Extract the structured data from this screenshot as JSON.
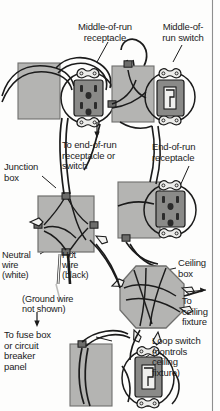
{
  "figure": {
    "type": "electrical-wiring-diagram",
    "background_color": "#fdfdfc",
    "ink_color": "#1b1b1b",
    "box_fill_color": "#b4b4b2",
    "device_fill_color": "#8a8a88",
    "border_color": "#8e8e8e"
  },
  "labels": {
    "middle_of_run_receptacle": "Middle-of-run\nreceptacle",
    "middle_of_run_switch": "Middle-of-\nrun switch",
    "to_end_of_run": "To end-of-run\nreceptacle or\nswitch",
    "end_of_run_receptacle": "End-of-run\nreceptacle",
    "junction_box": "Junction\nbox",
    "neutral_wire": "Neutral\nwire\n(white)",
    "hot_wire": "Hot\nwire\n(black)",
    "ground_note": "(Ground wire\nnot shown)",
    "ceiling_box": "Ceiling\nbox",
    "to_ceiling_fixture": "To\nceiling\nfixture",
    "to_fuse_box": "To fuse box\nor circuit\nbreaker\npanel",
    "loop_switch": "Loop switch\n(controls\nceiling\nfixture)"
  },
  "components": [
    {
      "name": "wall-box-upper-left",
      "kind": "rectangular-device-box"
    },
    {
      "name": "middle-of-run-receptacle",
      "kind": "duplex-receptacle",
      "outlets": 2
    },
    {
      "name": "wall-box-upper-middle",
      "kind": "rectangular-device-box"
    },
    {
      "name": "middle-of-run-switch",
      "kind": "toggle-switch"
    },
    {
      "name": "junction-box",
      "kind": "square-junction-box"
    },
    {
      "name": "wall-box-middle-right",
      "kind": "rectangular-device-box"
    },
    {
      "name": "end-of-run-receptacle",
      "kind": "duplex-receptacle",
      "outlets": 2
    },
    {
      "name": "ceiling-box",
      "kind": "octagonal-ceiling-box"
    },
    {
      "name": "wall-box-lower-left",
      "kind": "rectangular-device-box"
    },
    {
      "name": "loop-switch",
      "kind": "toggle-switch"
    }
  ],
  "arrows": [
    {
      "name": "arrow-to-end-of-run",
      "direction": "down"
    },
    {
      "name": "arrow-to-fuse-box",
      "direction": "down"
    },
    {
      "name": "arrow-to-ceiling-fixture",
      "direction": "right"
    }
  ]
}
